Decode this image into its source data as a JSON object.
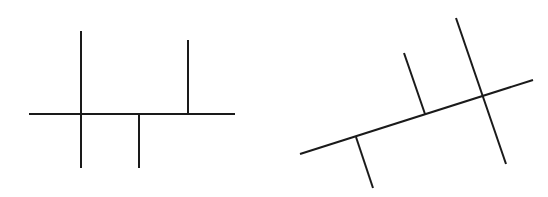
{
  "canvas": {
    "width": 548,
    "height": 197,
    "background": "#ffffff"
  },
  "style": {
    "stroke": "#1a1a1a",
    "stroke_width": 2
  },
  "figures": [
    {
      "name": "upright-figure",
      "description": "Horizontal line with three perpendicular strokes",
      "lines": [
        {
          "name": "main-axis",
          "x1": 29,
          "y1": 114,
          "x2": 235,
          "y2": 114
        },
        {
          "name": "crossing-stroke",
          "x1": 81,
          "y1": 31,
          "x2": 81,
          "y2": 168
        },
        {
          "name": "downward-stroke",
          "x1": 139,
          "y1": 114,
          "x2": 139,
          "y2": 168
        },
        {
          "name": "upward-stroke",
          "x1": 188,
          "y1": 40,
          "x2": 188,
          "y2": 114
        }
      ]
    },
    {
      "name": "rotated-figure",
      "description": "Tilted line with three perpendicular strokes",
      "lines": [
        {
          "name": "main-axis",
          "x1": 300,
          "y1": 154,
          "x2": 533,
          "y2": 80
        },
        {
          "name": "downward-stroke",
          "x1": 356,
          "y1": 137,
          "x2": 373,
          "y2": 188
        },
        {
          "name": "upward-stroke",
          "x1": 404,
          "y1": 53,
          "x2": 425,
          "y2": 114
        },
        {
          "name": "crossing-stroke",
          "x1": 456,
          "y1": 18,
          "x2": 506,
          "y2": 164
        }
      ]
    }
  ]
}
